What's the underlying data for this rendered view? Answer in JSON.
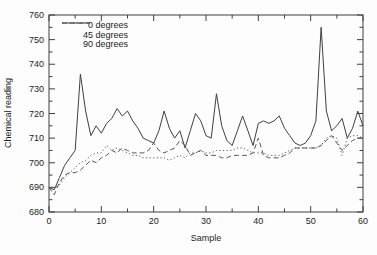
{
  "chart_data": {
    "type": "line",
    "title": "",
    "xlabel": "Sample",
    "ylabel": "Chemical reading",
    "xlim": [
      0,
      60
    ],
    "ylim": [
      680,
      760
    ],
    "x_ticks": [
      0,
      10,
      20,
      30,
      40,
      50,
      60
    ],
    "y_ticks": [
      680,
      690,
      700,
      710,
      720,
      730,
      740,
      750,
      760
    ],
    "minor_tick_step": 5,
    "grid": false,
    "legend_position": "top-left-inside",
    "colors": {
      "line": "#3f3f3f",
      "secondary_line": "#565656",
      "text": "#1c1c1c",
      "background": "#fdfdfd"
    },
    "x": [
      0,
      1,
      2,
      3,
      4,
      5,
      6,
      7,
      8,
      9,
      10,
      11,
      12,
      13,
      14,
      15,
      16,
      17,
      18,
      19,
      20,
      21,
      22,
      23,
      24,
      25,
      26,
      27,
      28,
      29,
      30,
      31,
      32,
      33,
      34,
      35,
      36,
      37,
      38,
      39,
      40,
      41,
      42,
      43,
      44,
      45,
      46,
      47,
      48,
      49,
      50,
      51,
      52,
      53,
      54,
      55,
      56,
      57,
      58,
      59,
      60
    ],
    "series": [
      {
        "name": "0 degrees",
        "style": "solid",
        "values": [
          690,
          689,
          694,
          699,
          702,
          705,
          736,
          721,
          711,
          715,
          712,
          716,
          718,
          722,
          719,
          721,
          717,
          714,
          710,
          709,
          708,
          713,
          721,
          714,
          710,
          713,
          706,
          713,
          720,
          717,
          711,
          710,
          728,
          715,
          709,
          707,
          713,
          719,
          713,
          707,
          716,
          717,
          716,
          717,
          719,
          714,
          711,
          708,
          707,
          708,
          711,
          717,
          755,
          721,
          713,
          715,
          718,
          710,
          714,
          721,
          715
        ]
      },
      {
        "name": "45 degrees",
        "style": "dashed",
        "values": [
          690,
          687,
          692,
          695,
          696,
          696,
          697,
          699,
          701,
          700,
          702,
          703,
          705,
          704,
          706,
          705,
          704,
          704,
          704,
          705,
          708,
          705,
          704,
          705,
          706,
          709,
          707,
          703,
          704,
          705,
          703,
          703,
          703,
          702,
          702,
          703,
          703,
          703,
          703,
          704,
          710,
          703,
          702,
          702,
          702,
          703,
          704,
          706,
          706,
          706,
          706,
          706,
          707,
          709,
          711,
          708,
          705,
          707,
          709,
          710,
          710
        ]
      },
      {
        "name": "90 degrees",
        "style": "dotted",
        "values": [
          690,
          690,
          691,
          694,
          696,
          698,
          700,
          701,
          703,
          704,
          704,
          707,
          705,
          706,
          705,
          704,
          703,
          703,
          702,
          702,
          702,
          702,
          702,
          701,
          702,
          703,
          702,
          704,
          704,
          705,
          704,
          704,
          705,
          705,
          705,
          705,
          706,
          706,
          705,
          704,
          704,
          704,
          703,
          703,
          703,
          704,
          705,
          706,
          706,
          706,
          706,
          706,
          707,
          710,
          711,
          710,
          703,
          710,
          711,
          711,
          710
        ]
      }
    ]
  }
}
